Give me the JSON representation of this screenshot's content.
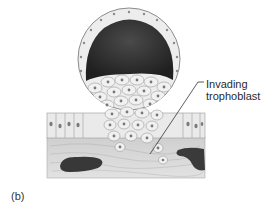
{
  "figure": {
    "panel_label": "(b)",
    "callouts": [
      {
        "id": "invading-trophoblast",
        "line1": "Invading",
        "line2": "trophoblast"
      }
    ],
    "colors": {
      "background": "#ffffff",
      "cavity": "#2e2e2e",
      "cell_fill": "#ececec",
      "cell_outline": "#9a9a9a",
      "nucleus": "#7a7a7a",
      "stroma": "#d2d2d2",
      "vessel": "#3a3a3a",
      "label_text": "#2a2a2a"
    }
  }
}
